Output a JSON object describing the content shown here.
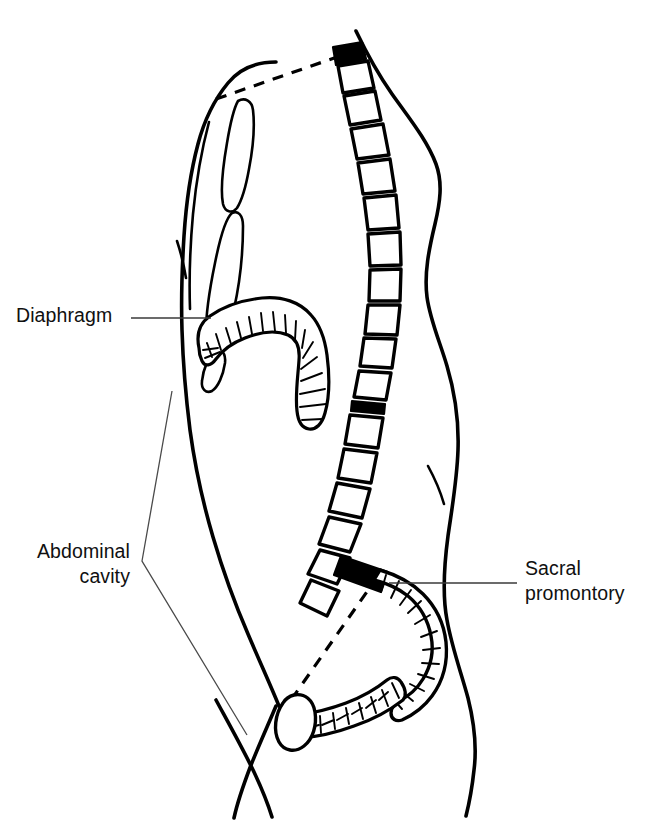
{
  "figure": {
    "background_color": "#ffffff",
    "ink_color": "#000000",
    "width": 652,
    "height": 830
  },
  "labels": [
    {
      "id": "diaphragm",
      "text": "Diaphragm",
      "align": "left",
      "leader": "horizontal line from text to left crus of diaphragm"
    },
    {
      "id": "abdominal-cavity",
      "text": "Abdominal\ncavity",
      "align": "right",
      "leader": "bent V leader to anterior abdominal wall"
    },
    {
      "id": "sacral-promontory",
      "text": "Sacral\npromontory",
      "align": "left",
      "leader": "horizontal line from text to black wedge at L5/S1"
    }
  ],
  "structures": [
    {
      "name": "body-outline",
      "description": "anterior and posterior trunk contour, neck to thigh"
    },
    {
      "name": "sternum",
      "description": "manubrium and body of sternum on anterior chest wall"
    },
    {
      "name": "vertebral-column",
      "description": "thoracic and lumbar vertebrae as rounded blocks"
    },
    {
      "name": "thoracic-vertebra-marked",
      "description": "black filled vertebra at top of column"
    },
    {
      "name": "intervertebral-disc-marked",
      "description": "black filled disc in lower thoracic region"
    },
    {
      "name": "sacral-promontory-wedge",
      "description": "black filled wedge at lumbosacral junction"
    },
    {
      "name": "diaphragm",
      "description": "hatched dome-shaped muscle separating thorax from abdomen"
    },
    {
      "name": "sacrum",
      "description": "segmented curved bone below lumbar spine"
    },
    {
      "name": "pelvic-brim",
      "description": "hatched band forming the pelvic inlet"
    },
    {
      "name": "pubic-symphysis",
      "description": "oval at the anterior pelvis"
    },
    {
      "name": "pelvic-inlet-plane",
      "description": "dashed line from sacral promontory to pubic symphysis"
    },
    {
      "name": "thoracic-inlet-plane",
      "description": "dashed line from sternum to upper thoracic vertebra"
    }
  ],
  "vertebrae_count": 17,
  "sacral_segments": 5
}
